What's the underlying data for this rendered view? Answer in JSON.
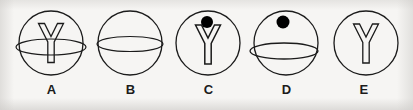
{
  "canvas": {
    "width": 413,
    "height": 110,
    "background_color": "#f6f5f3",
    "stroke_color": "#1b1b1b",
    "fill_color": "#000000",
    "label_color": "#1b1b1b"
  },
  "figures": [
    {
      "id": "A",
      "label": "A",
      "center_x": 51,
      "center_y": 43,
      "circle_radius": 32,
      "elements": [
        "circle-outline",
        "y-glyph-outline",
        "ellipse-overlay"
      ],
      "has_circle": true,
      "has_y_glyph": true,
      "has_ellipse": true,
      "has_dot": false,
      "ellipse": {
        "cx": 51,
        "cy": 47,
        "rx": 35,
        "ry": 8
      },
      "y_glyph": {
        "cx": 51,
        "cy": 42,
        "height": 40,
        "width": 28
      }
    },
    {
      "id": "B",
      "label": "B",
      "center_x": 130,
      "center_y": 43,
      "circle_radius": 32,
      "elements": [
        "circle-outline",
        "ellipse-overlay"
      ],
      "has_circle": true,
      "has_y_glyph": false,
      "has_ellipse": true,
      "has_dot": false,
      "ellipse": {
        "cx": 130,
        "cy": 44,
        "rx": 33,
        "ry": 7.5
      },
      "y_glyph": null
    },
    {
      "id": "C",
      "label": "C",
      "center_x": 208,
      "center_y": 43,
      "circle_radius": 32,
      "elements": [
        "circle-outline",
        "y-glyph-outline",
        "filled-dot"
      ],
      "has_circle": true,
      "has_y_glyph": true,
      "has_ellipse": false,
      "has_dot": true,
      "ellipse": null,
      "y_glyph": {
        "cx": 208,
        "cy": 44,
        "height": 40,
        "width": 28
      },
      "dot": {
        "cx": 207,
        "cy": 22,
        "r": 6
      }
    },
    {
      "id": "D",
      "label": "D",
      "center_x": 286,
      "center_y": 43,
      "circle_radius": 32,
      "elements": [
        "circle-outline",
        "filled-dot",
        "ellipse-overlay"
      ],
      "has_circle": true,
      "has_y_glyph": false,
      "has_ellipse": true,
      "has_dot": true,
      "ellipse": {
        "cx": 284,
        "cy": 51,
        "rx": 34,
        "ry": 8
      },
      "y_glyph": null,
      "dot": {
        "cx": 283,
        "cy": 22,
        "r": 6.5
      }
    },
    {
      "id": "E",
      "label": "E",
      "center_x": 366,
      "center_y": 43,
      "circle_radius": 32,
      "elements": [
        "circle-outline",
        "y-glyph-outline"
      ],
      "has_circle": true,
      "has_y_glyph": true,
      "has_ellipse": false,
      "has_dot": false,
      "ellipse": null,
      "y_glyph": {
        "cx": 366,
        "cy": 43,
        "height": 40,
        "width": 28
      }
    }
  ]
}
